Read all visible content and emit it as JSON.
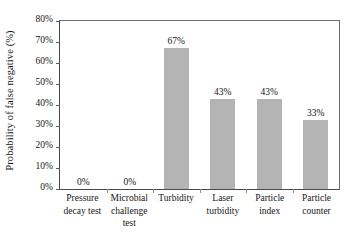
{
  "chart_data": {
    "type": "bar",
    "title": "",
    "xlabel": "",
    "ylabel": "Probability of false negative (%)",
    "categories": [
      "Pressure decay test",
      "Microbial challenge test",
      "Turbidity",
      "Laser turbidity",
      "Particle index",
      "Particle counter"
    ],
    "category_lines": [
      [
        "Pressure",
        "decay test"
      ],
      [
        "Microbial",
        "challenge test"
      ],
      [
        "Turbidity",
        ""
      ],
      [
        "Laser",
        "turbidity"
      ],
      [
        "Particle",
        "index"
      ],
      [
        "Particle",
        "counter"
      ]
    ],
    "values": [
      0,
      0,
      67,
      43,
      43,
      33
    ],
    "data_labels": [
      "0%",
      "0%",
      "67%",
      "43%",
      "43%",
      "33%"
    ],
    "ylim": [
      0,
      80
    ],
    "ytick_values": [
      0,
      10,
      20,
      30,
      40,
      50,
      60,
      70,
      80
    ],
    "ytick_labels": [
      "0%",
      "10%",
      "20%",
      "30%",
      "40%",
      "50%",
      "60%",
      "70%",
      "80%"
    ],
    "grid": false,
    "legend": null,
    "bar_color": "#b4b4b4",
    "axis_color": "#4a4a4a",
    "text_color": "#161616"
  }
}
